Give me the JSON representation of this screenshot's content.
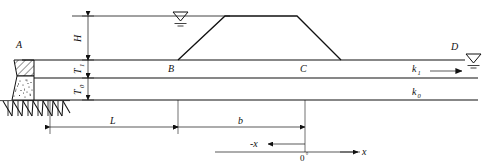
{
  "figure": {
    "type": "engineering-cross-section"
  },
  "labels": {
    "point_a": "A",
    "point_b": "B",
    "point_c": "C",
    "point_d": "D",
    "height_h": "H",
    "thickness_t1_base": "T",
    "thickness_t1_sub": "1",
    "thickness_t0_base": "T",
    "thickness_t0_sub": "0",
    "perm_k1_base": "k",
    "perm_k1_sub": "1",
    "perm_k0_base": "k",
    "perm_k0_sub": "0",
    "dim_l": "L",
    "dim_b": "b",
    "axis_x_positive": "x",
    "axis_x_negative": "-x",
    "origin": "0",
    "origin_mark": "°"
  },
  "icons": {
    "water_table_left": "water-level-symbol",
    "water_table_right": "water-level-symbol",
    "bedrock": "bedrock-hatch-icon",
    "structure_upper": "hatched-block-icon",
    "structure_lower": "stippled-block-icon",
    "flow_arrow_k1": "flow-arrow-right-icon",
    "embankment": "trapezoid-embankment-icon"
  },
  "colors": {
    "line": "#111111",
    "background": "#ffffff"
  }
}
